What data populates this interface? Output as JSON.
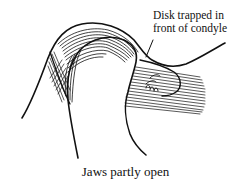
{
  "figure": {
    "callout": {
      "line1": "Disk trapped in",
      "line2": "front of condyle"
    },
    "caption": "Jaws partly open"
  },
  "colors": {
    "ink": "#111111",
    "background": "#ffffff"
  }
}
